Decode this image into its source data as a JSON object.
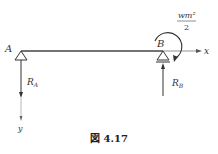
{
  "figure": {
    "caption": "図 4.17",
    "labels": {
      "point_a": "A",
      "point_b": "B",
      "axis_x": "x",
      "axis_y": "y",
      "reaction_a_main": "R",
      "reaction_a_sub": "A",
      "reaction_b_main": "R",
      "reaction_b_sub": "B",
      "moment_numerator": "wm²",
      "moment_denominator": "2"
    }
  }
}
